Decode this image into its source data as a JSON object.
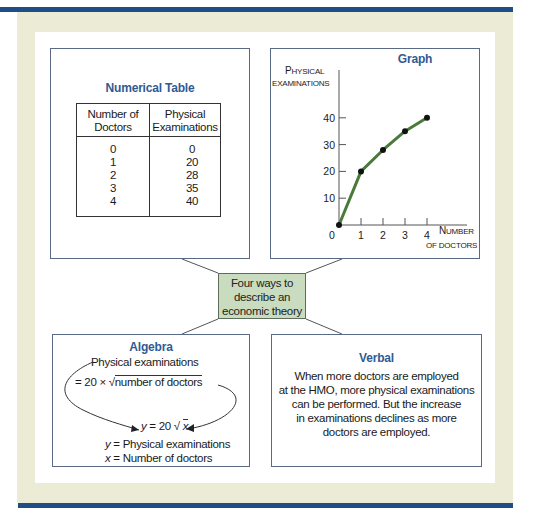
{
  "center": {
    "lines": [
      "Four ways to",
      "describe an",
      "economic theory"
    ]
  },
  "table_panel": {
    "title": "Numerical Table",
    "headers": [
      [
        "Number of",
        "Doctors"
      ],
      [
        "Physical",
        "Examinations"
      ]
    ],
    "rows": [
      {
        "doctors": "0",
        "exams": "0"
      },
      {
        "doctors": "1",
        "exams": "20"
      },
      {
        "doctors": "2",
        "exams": "28"
      },
      {
        "doctors": "3",
        "exams": "35"
      },
      {
        "doctors": "4",
        "exams": "40"
      }
    ]
  },
  "graph_panel": {
    "title": "Graph",
    "y_label_line1_cap": "P",
    "y_label_line1_rest": "HYSICAL",
    "y_label_line2": "EXAMINATIONS",
    "x_label_line1_cap": "N",
    "x_label_line1_rest": "UMBER",
    "x_label_line2": "OF DOCTORS"
  },
  "chart_data": {
    "type": "line",
    "title": "Graph",
    "xlabel": "Number of doctors",
    "ylabel": "Physical examinations",
    "x": [
      0,
      1,
      2,
      3,
      4
    ],
    "y": [
      0,
      20,
      28,
      35,
      40
    ],
    "x_ticks": [
      "0",
      "1",
      "2",
      "3",
      "4"
    ],
    "y_ticks": [
      "10",
      "20",
      "30",
      "40"
    ],
    "xlim": [
      0,
      5.5
    ],
    "ylim": [
      0,
      58
    ],
    "grid": false,
    "line_color": "#4a7a3a",
    "marker_color": "#111111"
  },
  "algebra_panel": {
    "title": "Algebra",
    "line1": "Physical examinations",
    "line2_prefix": "= 20 × √",
    "line2_radicand": "number of doctors",
    "formula_y": "y",
    "formula_rest": " = 20 √ ",
    "formula_x": "x",
    "def_y_var": "y",
    "def_y_text": " = Physical examinations",
    "def_x_var": "x",
    "def_x_text": " = Number of doctors"
  },
  "verbal_panel": {
    "title": "Verbal",
    "lines": [
      "When more doctors are employed",
      "at the HMO, more physical examinations",
      "can be performed.  But the increase",
      "in examinations declines as more",
      "doctors are employed."
    ]
  },
  "colors": {
    "frame_blue": "#1f4e86",
    "beige": "#ecebd6",
    "title_blue": "#2f5a94",
    "center_green": "#c9dcbf"
  }
}
